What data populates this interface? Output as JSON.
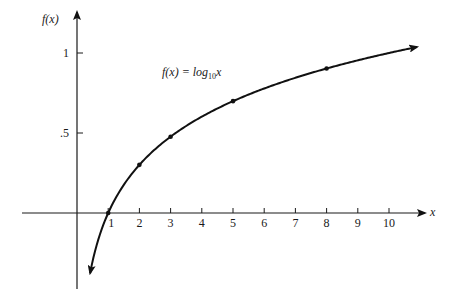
{
  "chart_data": {
    "type": "line",
    "annotation": {
      "prefix": "f(x) = log",
      "subscript": "10",
      "variable": "x"
    },
    "xlabel": "x",
    "ylabel": "f(x)",
    "xlim": [
      -1.8,
      11.1
    ],
    "ylim": [
      -0.48,
      1.12
    ],
    "x_ticks": [
      1,
      2,
      3,
      4,
      5,
      6,
      7,
      8,
      9,
      10
    ],
    "x_tick_labels": [
      "1",
      "2",
      "3",
      "4",
      "5",
      "6",
      "7",
      "8",
      "9",
      "10"
    ],
    "y_ticks": [
      0.5,
      1
    ],
    "y_tick_labels": [
      ".5",
      "1"
    ],
    "grid": false,
    "series": [
      {
        "name": "log10 x",
        "function": "log10",
        "x_range": [
          0.42,
          10.9
        ],
        "marked_points": [
          {
            "x": 1,
            "y": 0
          },
          {
            "x": 2,
            "y": 0.301
          },
          {
            "x": 3,
            "y": 0.477
          },
          {
            "x": 5,
            "y": 0.699
          },
          {
            "x": 8,
            "y": 0.903
          }
        ]
      }
    ],
    "colors": {
      "curve": "#111111",
      "axis": "#1a1a1a"
    }
  }
}
